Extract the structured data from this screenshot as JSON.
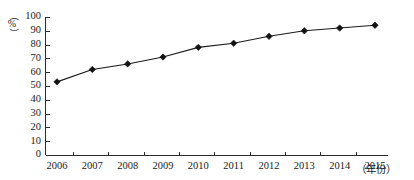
{
  "chart_data": {
    "type": "line",
    "title": "",
    "subtitle": "",
    "xlabel": "（年份）",
    "ylabel": "（%）",
    "ylabel_symbol": "%",
    "ylabel_paren_open": "（",
    "ylabel_paren_close": "）",
    "categories": [
      "2006",
      "2007",
      "2008",
      "2009",
      "2010",
      "2011",
      "2012",
      "2013",
      "2014",
      "2015"
    ],
    "x": [
      2006,
      2007,
      2008,
      2009,
      2010,
      2011,
      2012,
      2013,
      2014,
      2015
    ],
    "values": [
      53,
      62,
      66,
      71,
      78,
      81,
      86,
      90,
      92,
      94
    ],
    "series": [
      {
        "name": "",
        "values": [
          53,
          62,
          66,
          71,
          78,
          81,
          86,
          90,
          92,
          94
        ]
      }
    ],
    "ylim": [
      0,
      100
    ],
    "y_ticks": [
      0,
      10,
      20,
      30,
      40,
      50,
      60,
      70,
      80,
      90,
      100
    ],
    "y_tick_labels": [
      "0",
      "10",
      "20",
      "30",
      "40",
      "50",
      "60",
      "70",
      "80",
      "90",
      "100"
    ],
    "grid": false,
    "legend": false,
    "legend_position": "none",
    "marker": "diamond",
    "line_color": "#1a1a1a",
    "marker_color": "#111111",
    "axis_color": "#2b2b2b",
    "background": "#ffffff"
  }
}
